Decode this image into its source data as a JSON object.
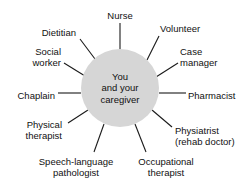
{
  "diagram": {
    "type": "radial-hub-and-spoke",
    "title": "",
    "hub": {
      "label": "You\nand your\ncaregiver",
      "fill_color": "#d6d6d6",
      "center_x": 120,
      "center_y": 88,
      "radius": 39
    },
    "line_color": "#1a1a1a",
    "background_color": "#ffffff",
    "text_color": "#111111",
    "nodes": [
      {
        "id": "nurse",
        "label": "Nurse",
        "anchor": "middle",
        "label_x": 120,
        "label_y": 15,
        "spoke_x1": 120,
        "spoke_y1": 49,
        "spoke_x2": 120,
        "spoke_y2": 23
      },
      {
        "id": "volunteer",
        "label": "Volunteer",
        "anchor": "start",
        "label_x": 160,
        "label_y": 28,
        "spoke_x1": 147,
        "spoke_y1": 60,
        "spoke_x2": 159,
        "spoke_y2": 36
      },
      {
        "id": "case-manager",
        "label": "Case\nmanager",
        "anchor": "start",
        "label_x": 180,
        "label_y": 57,
        "spoke_x1": 156,
        "spoke_y1": 77,
        "spoke_x2": 178,
        "spoke_y2": 63
      },
      {
        "id": "pharmacist",
        "label": "Pharmacist",
        "anchor": "start",
        "label_x": 188,
        "label_y": 95,
        "spoke_x1": 159,
        "spoke_y1": 93,
        "spoke_x2": 186,
        "spoke_y2": 93
      },
      {
        "id": "physiatrist",
        "label": "Physiatrist\n(rehab doctor)",
        "anchor": "start",
        "label_x": 175,
        "label_y": 136,
        "spoke_x1": 152,
        "spoke_y1": 110,
        "spoke_x2": 172,
        "spoke_y2": 127
      },
      {
        "id": "occupational-therapist",
        "label": "Occupational\ntherapist",
        "anchor": "middle",
        "label_x": 166,
        "label_y": 167,
        "spoke_x1": 135,
        "spoke_y1": 124,
        "spoke_x2": 146,
        "spoke_y2": 152
      },
      {
        "id": "speech-language-pathologist",
        "label": "Speech-language\npathologist",
        "anchor": "middle",
        "label_x": 76,
        "label_y": 167,
        "spoke_x1": 104,
        "spoke_y1": 124,
        "spoke_x2": 94,
        "spoke_y2": 152
      },
      {
        "id": "physical-therapist",
        "label": "Physical\ntherapist",
        "anchor": "end",
        "label_x": 62,
        "label_y": 130,
        "spoke_x1": 88,
        "spoke_y1": 110,
        "spoke_x2": 68,
        "spoke_y2": 123
      },
      {
        "id": "chaplain",
        "label": "Chaplain",
        "anchor": "end",
        "label_x": 55,
        "label_y": 95,
        "spoke_x1": 81,
        "spoke_y1": 93,
        "spoke_x2": 58,
        "spoke_y2": 93
      },
      {
        "id": "social-worker",
        "label": "Social\nworker",
        "anchor": "end",
        "label_x": 61,
        "label_y": 57,
        "spoke_x1": 85,
        "spoke_y1": 76,
        "spoke_x2": 64,
        "spoke_y2": 63
      },
      {
        "id": "dietitian",
        "label": "Dietitian",
        "anchor": "end",
        "label_x": 76,
        "label_y": 32,
        "spoke_x1": 95,
        "spoke_y1": 59,
        "spoke_x2": 80,
        "spoke_y2": 39
      }
    ]
  }
}
